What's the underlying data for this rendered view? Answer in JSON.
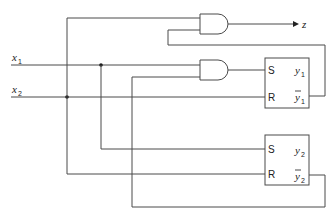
{
  "diagram": {
    "type": "sequential logic circuit",
    "inputs": [
      {
        "name": "x",
        "sub": "1"
      },
      {
        "name": "x",
        "sub": "2"
      }
    ],
    "output": {
      "name": "z"
    },
    "gates": [
      {
        "id": "and_top",
        "type": "AND",
        "output": "z"
      },
      {
        "id": "and_mid",
        "type": "AND",
        "output": "S of flip-flop 1"
      }
    ],
    "flip_flops": [
      {
        "id": "ff1",
        "type": "SR",
        "inputs": {
          "s": "S",
          "r": "R"
        },
        "outputs": {
          "q": {
            "name": "y",
            "sub": "1"
          },
          "qbar": {
            "name": "y",
            "sub": "1",
            "overline": true
          }
        }
      },
      {
        "id": "ff2",
        "type": "SR",
        "inputs": {
          "s": "S",
          "r": "R"
        },
        "outputs": {
          "q": {
            "name": "y",
            "sub": "2"
          },
          "qbar": {
            "name": "y",
            "sub": "2",
            "overline": true
          }
        }
      }
    ],
    "labels": {
      "x1": "x",
      "x1_sub": "1",
      "x2": "x",
      "x2_sub": "2",
      "z": "z",
      "ff1_s": "S",
      "ff1_r": "R",
      "ff1_q": "y",
      "ff1_q_sub": "1",
      "ff1_qbar": "y",
      "ff1_qbar_sub": "1",
      "ff2_s": "S",
      "ff2_r": "R",
      "ff2_q": "y",
      "ff2_q_sub": "2",
      "ff2_qbar": "y",
      "ff2_qbar_sub": "2"
    },
    "colors": {
      "wire": "#4a4a4a",
      "text": "#222222",
      "background": "#ffffff"
    }
  }
}
